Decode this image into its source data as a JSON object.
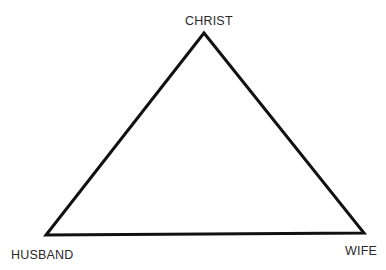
{
  "diagram": {
    "type": "triangle",
    "nodes": [
      {
        "id": "top",
        "label": "CHRIST",
        "position": "apex"
      },
      {
        "id": "left",
        "label": "HUSBAND",
        "position": "bottom-left"
      },
      {
        "id": "right",
        "label": "WIFE",
        "position": "bottom-right"
      }
    ],
    "edges": [
      {
        "from": "top",
        "to": "left"
      },
      {
        "from": "top",
        "to": "right"
      },
      {
        "from": "left",
        "to": "right"
      }
    ],
    "colors": {
      "stroke": "#111111",
      "text": "#2a2a2a",
      "background": "#ffffff"
    }
  }
}
